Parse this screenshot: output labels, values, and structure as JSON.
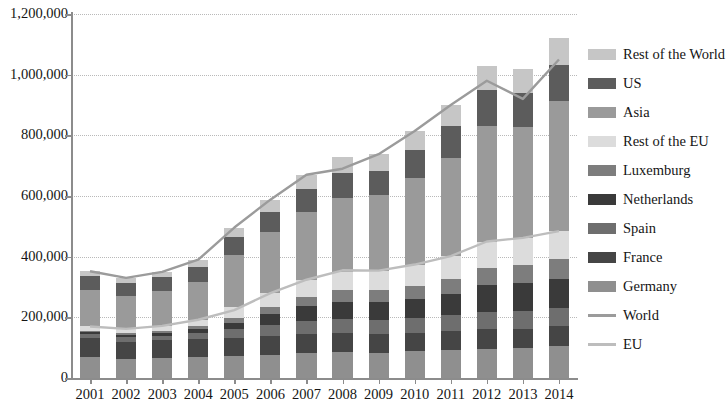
{
  "chart_data": {
    "type": "bar",
    "stacked": true,
    "title": "",
    "xlabel": "",
    "ylabel": "",
    "ylim": [
      0,
      1200000
    ],
    "ytick_values": [
      0,
      200000,
      400000,
      600000,
      800000,
      1000000,
      1200000
    ],
    "ytick_labels": [
      "0",
      "200,000",
      "400,000",
      "600,000",
      "800,000",
      "1,000,000",
      "1,200,000"
    ],
    "grid": true,
    "legend_position": "right",
    "categories": [
      "2001",
      "2002",
      "2003",
      "2004",
      "2005",
      "2006",
      "2007",
      "2008",
      "2009",
      "2010",
      "2011",
      "2012",
      "2013",
      "2014"
    ],
    "series": [
      {
        "name": "Germany",
        "kind": "bar",
        "color": "#8f8f8f",
        "values": [
          70000,
          62000,
          66000,
          68000,
          72000,
          76000,
          82000,
          85000,
          84000,
          88000,
          92000,
          96000,
          98000,
          104000
        ]
      },
      {
        "name": "France",
        "kind": "bar",
        "color": "#454545",
        "values": [
          62000,
          58000,
          58000,
          60000,
          60000,
          62000,
          64000,
          64000,
          62000,
          62000,
          64000,
          66000,
          64000,
          66000
        ]
      },
      {
        "name": "Spain",
        "kind": "bar",
        "color": "#6e6e6e",
        "values": [
          12000,
          14000,
          16000,
          22000,
          28000,
          36000,
          42000,
          46000,
          46000,
          48000,
          52000,
          56000,
          58000,
          60000
        ]
      },
      {
        "name": "Netherlands",
        "kind": "bar",
        "color": "#3a3a3a",
        "values": [
          8000,
          9000,
          10000,
          12000,
          22000,
          36000,
          48000,
          56000,
          58000,
          62000,
          68000,
          88000,
          92000,
          96000
        ]
      },
      {
        "name": "Luxemburg",
        "kind": "bar",
        "color": "#7d7d7d",
        "values": [
          4000,
          5000,
          6000,
          8000,
          16000,
          24000,
          32000,
          38000,
          40000,
          44000,
          50000,
          58000,
          62000,
          66000
        ]
      },
      {
        "name": "Rest of the EU",
        "kind": "bar",
        "color": "#dcdcdc",
        "values": [
          14000,
          14000,
          16000,
          22000,
          36000,
          46000,
          56000,
          62000,
          64000,
          70000,
          76000,
          84000,
          88000,
          92000
        ]
      },
      {
        "name": "Asia",
        "kind": "bar",
        "color": "#9a9a9a",
        "values": [
          120000,
          110000,
          116000,
          126000,
          172000,
          200000,
          222000,
          242000,
          250000,
          286000,
          324000,
          384000,
          366000,
          428000
        ]
      },
      {
        "name": "US",
        "kind": "bar",
        "color": "#5c5c5c",
        "values": [
          46000,
          42000,
          44000,
          48000,
          58000,
          68000,
          78000,
          84000,
          80000,
          92000,
          104000,
          118000,
          110000,
          120000
        ]
      },
      {
        "name": "Rest of the World",
        "kind": "bar",
        "color": "#c6c6c6",
        "values": [
          16000,
          16000,
          18000,
          24000,
          32000,
          40000,
          46000,
          52000,
          54000,
          62000,
          70000,
          80000,
          82000,
          88000
        ]
      },
      {
        "name": "World",
        "kind": "line",
        "color": "#9b9b9b",
        "values": [
          352000,
          330000,
          350000,
          390000,
          496000,
          588000,
          670000,
          690000,
          738000,
          814000,
          900000,
          980000,
          920000,
          1050000
        ]
      },
      {
        "name": "EU",
        "kind": "line",
        "color": "#bdbdbd",
        "values": [
          170000,
          162000,
          172000,
          192000,
          224000,
          280000,
          324000,
          355000,
          354000,
          374000,
          402000,
          450000,
          462000,
          484000
        ]
      }
    ]
  },
  "legend": {
    "items": [
      {
        "label": "Rest of the World",
        "color": "#c6c6c6",
        "kind": "bar"
      },
      {
        "label": "US",
        "color": "#5c5c5c",
        "kind": "bar"
      },
      {
        "label": "Asia",
        "color": "#9a9a9a",
        "kind": "bar"
      },
      {
        "label": "Rest of the EU",
        "color": "#dcdcdc",
        "kind": "bar"
      },
      {
        "label": "Luxemburg",
        "color": "#7d7d7d",
        "kind": "bar"
      },
      {
        "label": "Netherlands",
        "color": "#3a3a3a",
        "kind": "bar"
      },
      {
        "label": "Spain",
        "color": "#6e6e6e",
        "kind": "bar"
      },
      {
        "label": "France",
        "color": "#454545",
        "kind": "bar"
      },
      {
        "label": "Germany",
        "color": "#8f8f8f",
        "kind": "bar"
      },
      {
        "label": "World",
        "color": "#9b9b9b",
        "kind": "line"
      },
      {
        "label": "EU",
        "color": "#bdbdbd",
        "kind": "line"
      }
    ]
  },
  "style": {
    "axis_color": "#8c8c8c",
    "grid_color": "#b9b9b9",
    "text_color": "#151515",
    "background": "#ffffff"
  }
}
